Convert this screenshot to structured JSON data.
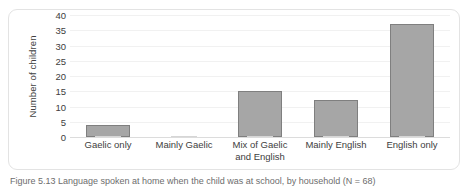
{
  "figure": {
    "caption": "Figure 5.13 Language spoken at home when the child was at school, by household (N = 68)"
  },
  "chart_data": {
    "type": "bar",
    "title": "",
    "xlabel": "",
    "ylabel": "Number of children",
    "categories": [
      "Gaelic only",
      "Mainly Gaelic",
      "Mix of Gaelic and English",
      "Mainly English",
      "English only"
    ],
    "category_lines": [
      [
        "Gaelic only"
      ],
      [
        "Mainly Gaelic"
      ],
      [
        "Mix of Gaelic",
        "and English"
      ],
      [
        "Mainly English"
      ],
      [
        "English only"
      ]
    ],
    "values": [
      4,
      0,
      15,
      12,
      37
    ],
    "ylim": [
      0,
      40
    ],
    "yticks": [
      40,
      35,
      30,
      25,
      20,
      15,
      10,
      5,
      0
    ],
    "grid": true,
    "legend": "none",
    "bar_color": "#a6a6a6",
    "bar_border_color": "#7f7f7f",
    "gridline_color": "#f1f1f1",
    "axis_color": "#dcdcdc"
  }
}
